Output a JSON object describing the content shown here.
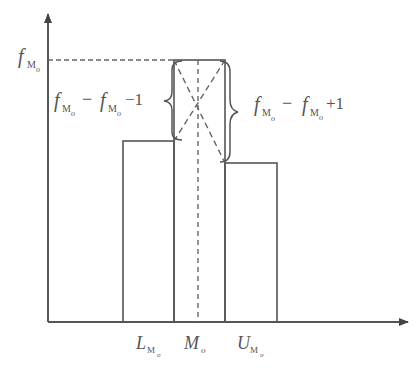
{
  "diagram": {
    "type": "histogram-mode-interpolation",
    "colors": {
      "stroke": "#555555",
      "background": "#ffffff"
    },
    "axes": {
      "origin": [
        48,
        322
      ],
      "x_end": 408,
      "y_end": 10
    },
    "bars": [
      {
        "name": "pre-modal",
        "x0": 123,
        "x1": 174,
        "top": 141
      },
      {
        "name": "modal",
        "x0": 174,
        "x1": 225,
        "top": 60
      },
      {
        "name": "post-modal",
        "x0": 225,
        "x1": 277,
        "top": 163
      }
    ],
    "y_label": {
      "main": "f",
      "sub": "M",
      "subsub": "o"
    },
    "x_labels": [
      {
        "main": "L",
        "sub": "M",
        "subsub": "o"
      },
      {
        "main": "M",
        "sub": "o",
        "subsub": ""
      },
      {
        "main": "U",
        "sub": "M",
        "subsub": "o"
      }
    ],
    "left_brace_label": {
      "t1": "f",
      "s1": "M",
      "ss1": "o",
      "op": "−",
      "t2": "f",
      "s2": "M",
      "ss2": "o",
      "tail": "−1"
    },
    "right_brace_label": {
      "t1": "f",
      "s1": "M",
      "ss1": "o",
      "op": "−",
      "t2": "f",
      "s2": "M",
      "ss2": "o",
      "tail": "+1"
    }
  }
}
